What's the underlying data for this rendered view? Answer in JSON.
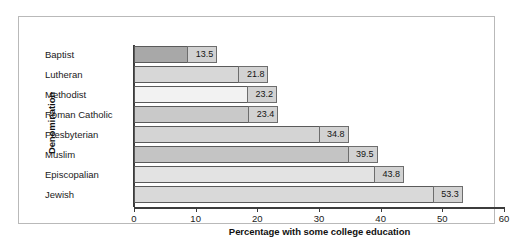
{
  "chart_data": {
    "type": "bar",
    "orientation": "horizontal",
    "title": "",
    "xlabel": "Percentage with some college education",
    "ylabel": "Denomination",
    "xlim": [
      0,
      60
    ],
    "xticks": [
      0,
      10,
      20,
      30,
      40,
      50,
      60
    ],
    "grid": false,
    "legend": "none",
    "categories": [
      "Baptist",
      "Lutheran",
      "Methodist",
      "Roman Catholic",
      "Presbyterian",
      "Muslim",
      "Episcopalian",
      "Jewish"
    ],
    "values": [
      13.5,
      21.8,
      23.2,
      23.4,
      34.8,
      39.5,
      43.8,
      53.3
    ],
    "value_labels": [
      "13.5",
      "21.8",
      "23.2",
      "23.4",
      "34.8",
      "39.5",
      "43.8",
      "53.3"
    ],
    "bar_colors": [
      "#a8a8a8",
      "#d7d7d7",
      "#f2f2f2",
      "#c9c9c9",
      "#d4d4d4",
      "#c4c4c4",
      "#e3e3e3",
      "#d9d9d9"
    ]
  },
  "colors": {
    "frame_border": "#b9b9b9",
    "axis": "#3c3c3c",
    "bar_outline": "#5a5a5a",
    "value_box_fill": "#d2d2d2",
    "text": "#1a1a1a",
    "background": "#ffffff"
  }
}
